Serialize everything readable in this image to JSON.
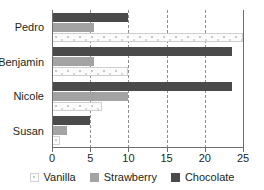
{
  "chart_data": {
    "type": "bar",
    "orientation": "horizontal",
    "title": "",
    "xlabel": "",
    "ylabel": "",
    "xlim": [
      0,
      25
    ],
    "xticks": [
      0,
      5,
      10,
      15,
      20,
      25
    ],
    "grid": true,
    "gridlines_at": [
      5,
      10,
      15,
      20
    ],
    "legend_position": "bottom",
    "categories": [
      "Pedro",
      "Benjamin",
      "Nicole",
      "Susan"
    ],
    "series": [
      {
        "name": "Vanilla",
        "color": "#fbfbfb",
        "values": [
          25,
          10,
          6.5,
          1
        ]
      },
      {
        "name": "Strawberry",
        "color": "#a3a3a3",
        "values": [
          5.5,
          5.5,
          10,
          2
        ]
      },
      {
        "name": "Chocolate",
        "color": "#4a4a4a",
        "values": [
          10,
          23.5,
          23.5,
          5
        ]
      }
    ]
  },
  "legend": {
    "items": [
      {
        "label": "Vanilla",
        "swatch": "vanilla-swatch"
      },
      {
        "label": "Strawberry",
        "swatch": "strawberry-swatch"
      },
      {
        "label": "Chocolate",
        "swatch": "chocolate-swatch"
      }
    ]
  },
  "colors": {
    "chocolate": "#4a4a4a",
    "strawberry": "#a3a3a3",
    "vanilla": "#fbfbfb",
    "axis": "#6e6e6e",
    "grid": "#8d8d8d",
    "text": "#231f20",
    "background": "#ffffff"
  }
}
